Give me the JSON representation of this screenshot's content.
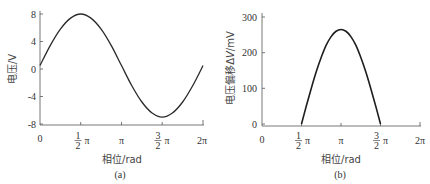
{
  "chart_data": [
    {
      "type": "line",
      "panel": "(a)",
      "title": "",
      "xlabel": "相位/rad",
      "ylabel": "电压/V",
      "x_ticks": [
        "0",
        "1/2 π",
        "π",
        "3/2 π",
        "2π"
      ],
      "x_tick_values": [
        0,
        1.5708,
        3.1416,
        4.7124,
        6.2832
      ],
      "y_ticks": [
        "8",
        "4",
        "0",
        "-4",
        "-8"
      ],
      "y_tick_values": [
        8,
        4,
        0,
        -4,
        -8
      ],
      "xlim": [
        0,
        6.2832
      ],
      "ylim": [
        -8,
        8
      ],
      "grid": false,
      "series": [
        {
          "name": "voltage",
          "x": [
            0,
            0.3927,
            0.7854,
            1.1781,
            1.5708,
            1.9635,
            2.3562,
            2.7489,
            3.1416,
            3.5343,
            3.927,
            4.3197,
            4.7124,
            5.1051,
            5.4978,
            5.8905,
            6.2832
          ],
          "values": [
            0.5,
            3.4,
            5.8,
            7.4,
            8.0,
            7.4,
            5.8,
            3.4,
            0.5,
            -2.4,
            -4.8,
            -6.4,
            -7.0,
            -6.4,
            -4.8,
            -2.4,
            0.5
          ]
        }
      ]
    },
    {
      "type": "line",
      "panel": "(b)",
      "title": "",
      "xlabel": "相位/rad",
      "ylabel": "电压偏移ΔV/mV",
      "x_ticks": [
        "0",
        "1/2 π",
        "π",
        "3/2 π",
        "2π"
      ],
      "x_tick_values": [
        0,
        1.5708,
        3.1416,
        4.7124,
        6.2832
      ],
      "y_ticks": [
        "300",
        "200",
        "100",
        "0"
      ],
      "y_tick_values": [
        300,
        200,
        100,
        0
      ],
      "xlim": [
        0,
        6.2832
      ],
      "ylim": [
        0,
        300
      ],
      "grid": false,
      "series": [
        {
          "name": "voltage offset",
          "x": [
            1.5708,
            1.7671,
            1.9635,
            2.1598,
            2.3562,
            2.5525,
            2.7489,
            2.9452,
            3.1416,
            3.3379,
            3.5343,
            3.7306,
            3.927,
            4.1233,
            4.3197,
            4.516,
            4.7124
          ],
          "values": [
            0,
            52,
            101,
            147,
            187,
            221,
            245,
            260,
            265,
            260,
            245,
            221,
            187,
            147,
            101,
            52,
            0
          ]
        }
      ]
    }
  ],
  "panels": {
    "a": {
      "caption": "(a)",
      "xlabel": "相位/rad",
      "ylabel": "电压/V",
      "y_ticks": [
        "8",
        "4",
        "0",
        "-4",
        "-8"
      ],
      "x_ticks": {
        "t0": "0",
        "t1_num": "1",
        "t1_den": "2",
        "t2": "π",
        "t3_num": "3",
        "t3_den": "2",
        "t4": "2π",
        "pi": "π"
      }
    },
    "b": {
      "caption": "(b)",
      "xlabel": "相位/rad",
      "ylabel_prefix": "电压偏移Δ",
      "ylabel_var": "V",
      "ylabel_unit": "/mV",
      "y_ticks": [
        "300",
        "200",
        "100",
        "0"
      ],
      "x_ticks": {
        "t0": "0",
        "t1_num": "1",
        "t1_den": "2",
        "t2": "π",
        "t3_num": "3",
        "t3_den": "2",
        "t4": "2π",
        "pi": "π"
      }
    }
  },
  "colors": {
    "axis": "#555555",
    "curve": "#2a2a2a",
    "text": "#333333"
  }
}
